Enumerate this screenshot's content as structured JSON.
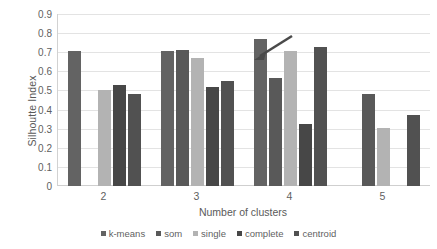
{
  "chart_data": {
    "type": "bar",
    "title": "",
    "xlabel": "Number of clusters",
    "ylabel": "Silhoutte Index",
    "categories": [
      "2",
      "3",
      "4",
      "5"
    ],
    "ylim": [
      0,
      0.9
    ],
    "yticks": [
      "0.9",
      "0.8",
      "0.7",
      "0.6",
      "0.5",
      "0.4",
      "0.3",
      "0.2",
      "0.1",
      "0"
    ],
    "ytick_values": [
      0.9,
      0.8,
      0.7,
      0.6,
      0.5,
      0.4,
      0.3,
      0.2,
      0.1,
      0
    ],
    "grid": true,
    "legend_position": "bottom",
    "series": [
      {
        "name": "k-means",
        "color": "#636363",
        "values": [
          0.705,
          0.707,
          0.768,
          null
        ]
      },
      {
        "name": "som",
        "color": "#595959",
        "values": [
          null,
          0.713,
          0.566,
          0.482
        ]
      },
      {
        "name": "single",
        "color": "#b3b3b3",
        "values": [
          0.502,
          0.668,
          0.709,
          0.304
        ]
      },
      {
        "name": "complete",
        "color": "#474747",
        "values": [
          0.528,
          0.518,
          0.323,
          null
        ]
      },
      {
        "name": "centroid",
        "color": "#515151",
        "values": [
          0.482,
          0.552,
          0.729,
          0.371
        ]
      }
    ],
    "annotations": [
      {
        "name": "arrow-pointer",
        "type": "arrow",
        "points_to_series": "k-means",
        "points_to_category": "4",
        "color": "#4a4a4a"
      }
    ]
  }
}
